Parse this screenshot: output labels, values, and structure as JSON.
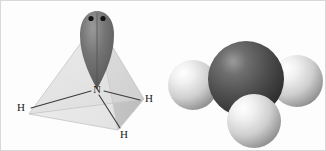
{
  "figure": {
    "background_color": "#fdfdfd",
    "border_color": "#d8d8d8",
    "width": 326,
    "height": 151
  },
  "panels": [
    {
      "id": "vsepr",
      "name": "tetrahedral-lone-pair-diagram",
      "description": "Line diagram of ammonia inside a tetrahedron with a lone pair lobe at the apex"
    },
    {
      "id": "ballstick",
      "name": "ball-and-stick-model",
      "description": "Three dimensional shaded sphere model of ammonia"
    }
  ],
  "vsepr": {
    "central_atom": {
      "symbol": "N",
      "name": "nitrogen",
      "x": 96,
      "y": 88,
      "label_x": 96,
      "label_y": 91
    },
    "hydrogens": [
      {
        "symbol": "H",
        "name": "hydrogen-left",
        "label_x": 20,
        "label_y": 110,
        "bond_x": 30,
        "bond_y": 107
      },
      {
        "symbol": "H",
        "name": "hydrogen-right",
        "label_x": 148,
        "label_y": 101,
        "bond_x": 139,
        "bond_y": 99
      },
      {
        "symbol": "H",
        "name": "hydrogen-bottom",
        "label_x": 123,
        "label_y": 137,
        "bond_x": 119,
        "bond_y": 127
      }
    ],
    "lone_pair": {
      "name": "lone-pair-lobe",
      "electron_count": 2,
      "lobe_fill": "#6d6d6d",
      "lobe_highlight": "#8f8f8f",
      "electron_color": "#141414",
      "electrons": [
        {
          "x": 90,
          "y": 17
        },
        {
          "x": 102,
          "y": 17
        }
      ]
    },
    "tetrahedron": {
      "name": "tetrahedron-outline",
      "apex": {
        "x": 96,
        "y": 20
      },
      "vertex_left": {
        "x": 28,
        "y": 113
      },
      "vertex_right": {
        "x": 143,
        "y": 98
      },
      "vertex_front": {
        "x": 117,
        "y": 129
      },
      "face_left_fill": "#ececec",
      "face_right_fill": "#c9c9c9",
      "face_front_fill": "#e2e2e2",
      "edge_color": "#c4c4c4"
    },
    "bond_color": "#3a3a3a",
    "bond_width": 1.1
  },
  "ballstick": {
    "nitrogen": {
      "name": "nitrogen-sphere",
      "symbol": "N",
      "cx": 245,
      "cy": 78,
      "r": 38,
      "base_color": "#4d4d4d",
      "shadow_color": "#2b2b2b",
      "highlight_color": "#8a8a8a"
    },
    "hydrogens": [
      {
        "name": "hydrogen-sphere-left",
        "symbol": "H",
        "cx": 192,
        "cy": 84,
        "r": 25
      },
      {
        "name": "hydrogen-sphere-right",
        "symbol": "H",
        "cx": 296,
        "cy": 80,
        "r": 26
      },
      {
        "name": "hydrogen-sphere-bottom",
        "symbol": "H",
        "cx": 253,
        "cy": 120,
        "r": 27
      }
    ],
    "hydrogen_colors": {
      "base_color": "#d9d9d9",
      "shadow_color": "#8d8d8d",
      "highlight_color": "#ffffff"
    },
    "bond_color": "#c0c0c0",
    "bond_width": 9
  }
}
